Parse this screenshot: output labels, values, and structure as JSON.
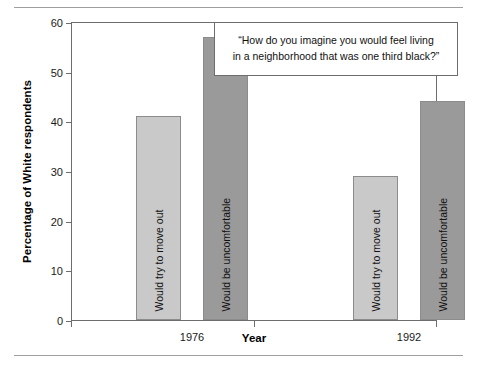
{
  "chart_data": {
    "type": "bar",
    "title": "",
    "subtitle": "",
    "xlabel": "Year",
    "ylabel": "Percentage of White respondents",
    "categories": [
      "1976",
      "1992"
    ],
    "ylim": [
      0,
      60
    ],
    "yticks": [
      0,
      10,
      20,
      30,
      40,
      50,
      60
    ],
    "ytick_labels": [
      "0",
      "10",
      "20",
      "30",
      "40",
      "50",
      "60"
    ],
    "grid": false,
    "legend": "none (bars labeled in place)",
    "series": [
      {
        "name": "Would try to move out",
        "color": "#c9c9c9",
        "values": [
          41,
          29
        ]
      },
      {
        "name": "Would be uncomfortable",
        "color": "#9a9a9a",
        "values": [
          57,
          44
        ]
      }
    ],
    "bars": [
      {
        "category": "1976",
        "label": "Would try to move out",
        "value": 41,
        "color": "#c9c9c9"
      },
      {
        "category": "1976",
        "label": "Would be uncomfortable",
        "value": 57,
        "color": "#9a9a9a"
      },
      {
        "category": "1992",
        "label": "Would try to move out",
        "value": 29,
        "color": "#c9c9c9"
      },
      {
        "category": "1992",
        "label": "Would be uncomfortable",
        "value": 44,
        "color": "#9a9a9a"
      }
    ],
    "annotations": [
      {
        "name": "survey-question",
        "line1": "“How do you imagine you would feel living",
        "line2": "in a neighborhood that was one third black?”"
      }
    ]
  },
  "caption": {
    "line1": "“How do you imagine you would feel living",
    "line2": "in a neighborhood that was one third black?”"
  }
}
